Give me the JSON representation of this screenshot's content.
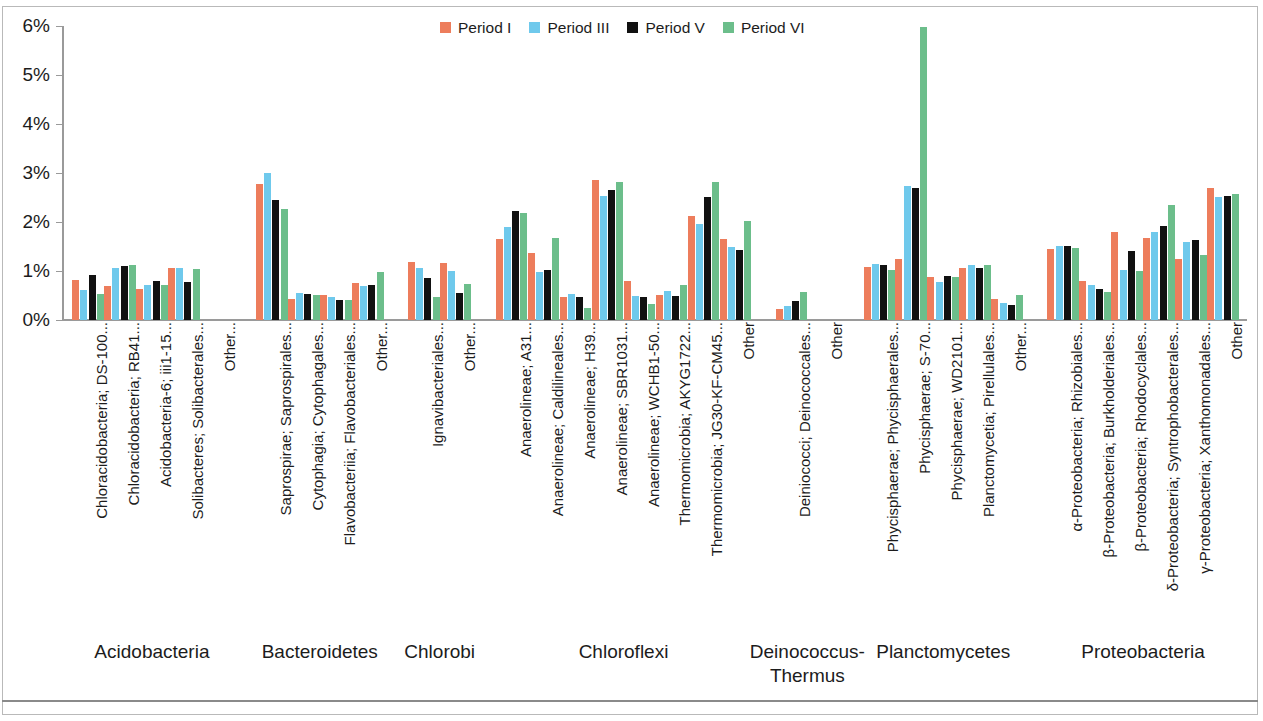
{
  "chart_data": {
    "type": "bar",
    "title": "",
    "xlabel": "",
    "ylabel": "",
    "ylim": [
      0,
      6
    ],
    "ytick_labels": [
      "0%",
      "1%",
      "2%",
      "3%",
      "4%",
      "5%",
      "6%"
    ],
    "ytick_values": [
      0,
      1,
      2,
      3,
      4,
      5,
      6
    ],
    "grid": false,
    "legend_position": "top-center",
    "series": [
      {
        "name": "Period I",
        "color": "#ED7D5C"
      },
      {
        "name": "Period III",
        "color": "#6FC9EC"
      },
      {
        "name": "Period V",
        "color": "#111111"
      },
      {
        "name": "Period VI",
        "color": "#6CBE8B"
      }
    ],
    "groups": [
      {
        "name": "Acidobacteria",
        "categories": [
          {
            "label": "Chloracidobacteria; DS-100...",
            "values": [
              0.82,
              0.62,
              0.92,
              0.54
            ]
          },
          {
            "label": "Chloracidobacteria; RB41...",
            "values": [
              0.7,
              1.06,
              1.1,
              1.12
            ]
          },
          {
            "label": "Acidobacteria-6; iii1-15...",
            "values": [
              0.63,
              0.71,
              0.8,
              0.72
            ]
          },
          {
            "label": "Solibacteres; Solibacterales...",
            "values": [
              1.06,
              1.07,
              0.77,
              1.05
            ]
          },
          {
            "label": "Other...",
            "values": [
              0.0,
              0.0,
              0.0,
              0.0
            ]
          }
        ]
      },
      {
        "name": "Bacteroidetes",
        "categories": [
          {
            "label": "Saprospirae; Saprospirales...",
            "values": [
              2.78,
              3.0,
              2.45,
              2.27
            ]
          },
          {
            "label": "Cytophagia; Cytophagales...",
            "values": [
              0.43,
              0.55,
              0.53,
              0.52
            ]
          },
          {
            "label": "Flavobacteriia; Flavobacteriales...",
            "values": [
              0.51,
              0.47,
              0.41,
              0.4
            ]
          },
          {
            "label": "Other...",
            "values": [
              0.76,
              0.7,
              0.72,
              0.99
            ]
          }
        ]
      },
      {
        "name": "Chlorobi",
        "categories": [
          {
            "label": "Ignavibacteriales...",
            "values": [
              1.18,
              1.06,
              0.85,
              0.47
            ]
          },
          {
            "label": "Other...",
            "values": [
              1.17,
              1.0,
              0.55,
              0.74
            ]
          }
        ]
      },
      {
        "name": "Chloroflexi",
        "categories": [
          {
            "label": "Anaerolineae; A31...",
            "values": [
              1.66,
              1.89,
              2.23,
              2.18
            ]
          },
          {
            "label": "Anaerolineae; Caldilineales...",
            "values": [
              1.36,
              0.98,
              1.02,
              1.67
            ]
          },
          {
            "label": "Anaerolineae; H39...",
            "values": [
              0.47,
              0.54,
              0.46,
              0.25
            ]
          },
          {
            "label": "Anaerolineae; SBR1031...",
            "values": [
              2.85,
              2.54,
              2.66,
              2.81
            ]
          },
          {
            "label": "Anaerolineae; WCHB1-50...",
            "values": [
              0.79,
              0.49,
              0.46,
              0.32
            ]
          },
          {
            "label": "Thermomicrobia; AKYG1722...",
            "values": [
              0.52,
              0.59,
              0.5,
              0.72
            ]
          },
          {
            "label": "Thermomicrobia; JG30-KF-CM45...",
            "values": [
              2.12,
              1.96,
              2.52,
              2.81
            ]
          },
          {
            "label": "Other",
            "values": [
              1.66,
              1.48,
              1.43,
              2.02
            ]
          }
        ]
      },
      {
        "name": "Deinococcus-\nThermus",
        "categories": [
          {
            "label": "Deiniococci; Deinococcales...",
            "values": [
              0.23,
              0.28,
              0.38,
              0.58
            ]
          },
          {
            "label": "Other",
            "values": [
              0.0,
              0.0,
              0.0,
              0.0
            ]
          }
        ]
      },
      {
        "name": "Planctomycetes",
        "categories": [
          {
            "label": "Phycisphaerae; Phycisphaerales...",
            "values": [
              1.09,
              1.14,
              1.12,
              1.03
            ]
          },
          {
            "label": "Phycisphaerae; S-70...",
            "values": [
              1.25,
              2.74,
              2.7,
              5.97
            ]
          },
          {
            "label": "Phycisphaerae; WD2101...",
            "values": [
              0.88,
              0.78,
              0.9,
              0.88
            ]
          },
          {
            "label": "Planctomycetia; Pirellulales...",
            "values": [
              1.06,
              1.12,
              1.07,
              1.13
            ]
          },
          {
            "label": "Other...",
            "values": [
              0.42,
              0.35,
              0.3,
              0.51
            ]
          }
        ]
      },
      {
        "name": "Proteobacteria",
        "categories": [
          {
            "label": "α-Proteobacteria; Rhizobiales...",
            "values": [
              1.45,
              1.52,
              1.52,
              1.47
            ]
          },
          {
            "label": "β-Proteobacteria; Burkholderiales...",
            "values": [
              0.79,
              0.72,
              0.63,
              0.58
            ]
          },
          {
            "label": "β-Proteobacteria; Rhodocyclales...",
            "values": [
              1.79,
              1.02,
              1.4,
              1.01
            ]
          },
          {
            "label": "δ-Proteobacteria; Syntrophobacterales...",
            "values": [
              1.68,
              1.79,
              1.91,
              2.34
            ]
          },
          {
            "label": "γ-Proteobacteria; Xanthomonadales...",
            "values": [
              1.24,
              1.59,
              1.64,
              1.33
            ]
          },
          {
            "label": "Other",
            "values": [
              2.7,
              2.52,
              2.54,
              2.58
            ]
          }
        ]
      }
    ]
  }
}
